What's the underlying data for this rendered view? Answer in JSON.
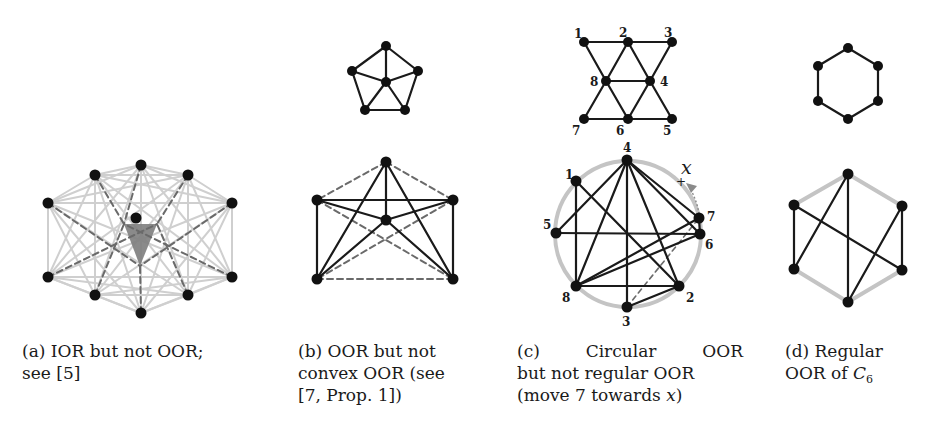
{
  "colors": {
    "edge_dark": "#1a1a1a",
    "edge_light": "#cfcfcf",
    "edge_dashed": "#6a6a6a",
    "triangle_fill": "#7d7d7d",
    "node": "#111111",
    "circle_ring": "#c4c4c4",
    "arrow": "#8a8a8a"
  },
  "subfigures": [
    {
      "id": "a",
      "caption_label": "(a)",
      "caption_text": "IOR but not OOR;",
      "caption_line2": "see [5]",
      "graph": {
        "outer_nodes": [
          [
            141,
            165
          ],
          [
            188,
            175
          ],
          [
            232,
            203
          ],
          [
            232,
            277
          ],
          [
            188,
            295
          ],
          [
            141,
            313
          ],
          [
            95,
            295
          ],
          [
            48,
            277
          ],
          [
            48,
            203
          ],
          [
            95,
            175
          ]
        ],
        "center_node": [
          136,
          218
        ],
        "triangle": [
          [
            124,
            224
          ],
          [
            157,
            224
          ],
          [
            140,
            266
          ]
        ]
      }
    },
    {
      "id": "b",
      "caption_label": "(b)",
      "caption_text": "OOR but not",
      "caption_line2": "convex OOR (see",
      "caption_line3": "[7, Prop. 1])",
      "top_graph": {
        "nodes": [
          [
            386,
            46
          ],
          [
            418,
            71
          ],
          [
            405,
            110
          ],
          [
            365,
            110
          ],
          [
            352,
            71
          ],
          [
            386,
            82
          ]
        ],
        "edges": [
          [
            0,
            1
          ],
          [
            1,
            2
          ],
          [
            2,
            3
          ],
          [
            3,
            4
          ],
          [
            4,
            0
          ],
          [
            5,
            0
          ],
          [
            5,
            1
          ],
          [
            5,
            2
          ],
          [
            5,
            3
          ],
          [
            5,
            4
          ]
        ]
      },
      "bottom_graph": {
        "nodes": [
          [
            386,
            162
          ],
          [
            453,
            200
          ],
          [
            453,
            279
          ],
          [
            317,
            279
          ],
          [
            317,
            200
          ],
          [
            386,
            220
          ]
        ],
        "solid_edges": [
          [
            0,
            5
          ],
          [
            0,
            3
          ],
          [
            0,
            2
          ],
          [
            4,
            1
          ],
          [
            4,
            3
          ],
          [
            1,
            2
          ],
          [
            5,
            4
          ],
          [
            5,
            1
          ],
          [
            5,
            3
          ],
          [
            5,
            2
          ]
        ],
        "dashed_edges": [
          [
            0,
            4
          ],
          [
            0,
            1
          ],
          [
            3,
            2
          ],
          [
            4,
            2
          ],
          [
            1,
            3
          ]
        ]
      }
    },
    {
      "id": "c",
      "caption_label": "(c)",
      "caption_word1": "Circular",
      "caption_word2": "OOR",
      "caption_line2": "but not regular OOR",
      "caption_line3_pre": "(move 7 towards ",
      "caption_line3_var": "x",
      "caption_line3_post": ")",
      "top_graph": {
        "nodes": {
          "1": [
            584,
            42
          ],
          "2": [
            628,
            42
          ],
          "3": [
            672,
            42
          ],
          "4": [
            650,
            81
          ],
          "5": [
            672,
            119
          ],
          "6": [
            628,
            119
          ],
          "7": [
            584,
            119
          ],
          "8": [
            606,
            81
          ]
        },
        "labels": {
          "1": [
            574,
            38
          ],
          "2": [
            619,
            37
          ],
          "3": [
            664,
            37
          ],
          "4": [
            660,
            86
          ],
          "5": [
            663,
            135
          ],
          "6": [
            616,
            135
          ],
          "7": [
            572,
            135
          ],
          "8": [
            590,
            86
          ]
        },
        "edges": [
          [
            "1",
            "2"
          ],
          [
            "2",
            "3"
          ],
          [
            "1",
            "8"
          ],
          [
            "2",
            "8"
          ],
          [
            "2",
            "4"
          ],
          [
            "3",
            "4"
          ],
          [
            "8",
            "4"
          ],
          [
            "8",
            "7"
          ],
          [
            "8",
            "6"
          ],
          [
            "4",
            "6"
          ],
          [
            "4",
            "5"
          ],
          [
            "7",
            "6"
          ],
          [
            "6",
            "5"
          ]
        ]
      },
      "bottom_graph": {
        "circle": {
          "cx": 628,
          "cy": 234,
          "r": 73
        },
        "nodes": {
          "1": [
            576,
            181
          ],
          "2": [
            679,
            286
          ],
          "3": [
            627,
            307
          ],
          "4": [
            627,
            160
          ],
          "5": [
            556,
            233
          ],
          "6": [
            700,
            234
          ],
          "7": [
            699,
            218
          ],
          "8": [
            576,
            286
          ]
        },
        "labels": {
          "1": [
            565,
            179
          ],
          "2": [
            686,
            302
          ],
          "3": [
            622,
            326
          ],
          "4": [
            623,
            152
          ],
          "5": [
            543,
            229
          ],
          "6": [
            705,
            249
          ],
          "7": [
            707,
            221
          ],
          "8": [
            562,
            302
          ]
        },
        "edges": [
          [
            "4",
            "5"
          ],
          [
            "4",
            "8"
          ],
          [
            "4",
            "3"
          ],
          [
            "4",
            "2"
          ],
          [
            "4",
            "6"
          ],
          [
            "4",
            "7"
          ],
          [
            "1",
            "8"
          ],
          [
            "1",
            "2"
          ],
          [
            "5",
            "6"
          ],
          [
            "8",
            "2"
          ],
          [
            "8",
            "6"
          ],
          [
            "8",
            "7"
          ],
          [
            "3",
            "2"
          ],
          [
            "7",
            "6"
          ]
        ],
        "dashed_edges": [
          [
            "3",
            "7"
          ]
        ],
        "target_marker": {
          "plus": [
            680,
            182
          ],
          "label": "x",
          "label_pos": [
            681,
            174
          ]
        }
      }
    },
    {
      "id": "d",
      "caption_label": "(d)",
      "caption_text": "Regular",
      "caption_line2_pre": "OOR of ",
      "caption_var": "C",
      "caption_sub": "6",
      "top_graph": {
        "nodes": [
          [
            848,
            48
          ],
          [
            878,
            66
          ],
          [
            878,
            101
          ],
          [
            848,
            119
          ],
          [
            818,
            101
          ],
          [
            818,
            66
          ]
        ],
        "edges": [
          [
            0,
            1
          ],
          [
            1,
            2
          ],
          [
            2,
            3
          ],
          [
            3,
            4
          ],
          [
            4,
            5
          ],
          [
            5,
            0
          ]
        ]
      },
      "bottom_graph": {
        "nodes": [
          [
            848,
            174
          ],
          [
            902,
            206
          ],
          [
            902,
            270
          ],
          [
            848,
            302
          ],
          [
            794,
            269
          ],
          [
            794,
            205
          ]
        ],
        "gray_edges": [
          [
            0,
            1
          ],
          [
            0,
            5
          ],
          [
            4,
            3
          ],
          [
            3,
            2
          ]
        ],
        "dark_edges": [
          [
            5,
            4
          ],
          [
            1,
            2
          ],
          [
            0,
            3
          ],
          [
            0,
            4
          ],
          [
            5,
            2
          ],
          [
            1,
            3
          ]
        ]
      }
    }
  ]
}
